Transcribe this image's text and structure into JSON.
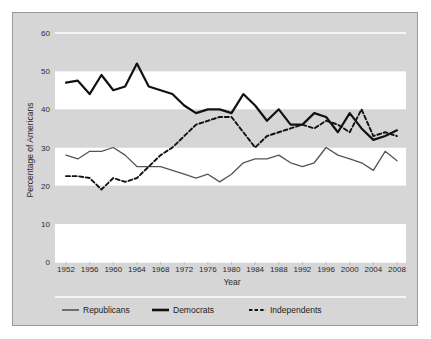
{
  "figure": {
    "background_color": "#ffffff",
    "panel_color": "#d6d6d6",
    "panel_border_color": "#9a9a9a",
    "band_light_color": "#ffffff",
    "band_dark_color": "#d6d6d6"
  },
  "chart_data": {
    "type": "line",
    "title": "",
    "xlabel": "Year",
    "ylabel": "Percentage of Americans",
    "xlim": [
      1952,
      2008
    ],
    "ylim": [
      0,
      60
    ],
    "ytick_step": 10,
    "xtick_step": 4,
    "grid": false,
    "alternating_bands": true,
    "legend_position": "bottom",
    "ytick_labels": [
      "0",
      "10",
      "20",
      "30",
      "40",
      "50",
      "60"
    ],
    "ytick_values": [
      0,
      10,
      20,
      30,
      40,
      50,
      60
    ],
    "xtick_labels": [
      "1952",
      "1956",
      "1960",
      "1964",
      "1968",
      "1972",
      "1976",
      "1980",
      "1984",
      "1988",
      "1992",
      "1996",
      "2000",
      "2004",
      "2008"
    ],
    "xtick_values": [
      1952,
      1956,
      1960,
      1964,
      1968,
      1972,
      1976,
      1980,
      1984,
      1988,
      1992,
      1996,
      2000,
      2004,
      2008
    ],
    "x": [
      1952,
      1954,
      1956,
      1958,
      1960,
      1962,
      1964,
      1966,
      1968,
      1970,
      1972,
      1974,
      1976,
      1978,
      1980,
      1982,
      1984,
      1986,
      1988,
      1990,
      1992,
      1994,
      1996,
      1998,
      2000,
      2002,
      2004,
      2006,
      2008
    ],
    "series": [
      {
        "name": "Republicans",
        "color": "#555555",
        "style": "solid",
        "width": 1.3,
        "values": [
          28,
          27,
          29,
          29,
          30,
          28,
          25,
          25,
          25,
          24,
          23,
          22,
          23,
          21,
          23,
          26,
          27,
          27,
          28,
          26,
          25,
          26,
          30,
          28,
          27,
          26,
          24,
          29,
          26.5
        ]
      },
      {
        "name": "Democrats",
        "color": "#111111",
        "style": "solid",
        "width": 2.2,
        "values": [
          47,
          47.5,
          44,
          49,
          45,
          46,
          52,
          46,
          45,
          44,
          41,
          39,
          40,
          40,
          39,
          44,
          41,
          37,
          40,
          36,
          36,
          39,
          38,
          34,
          39,
          35,
          32,
          33,
          34.5
        ]
      },
      {
        "name": "Independents",
        "color": "#111111",
        "style": "dashed",
        "width": 1.9,
        "values": [
          22.5,
          22.5,
          22,
          19,
          22,
          21,
          22,
          25,
          28,
          30,
          33,
          36,
          37,
          38,
          38,
          34,
          30,
          33,
          34,
          35,
          36,
          35,
          37,
          36,
          34,
          40,
          33,
          34,
          33
        ]
      }
    ]
  },
  "legend": {
    "items": [
      {
        "label": "Republicans",
        "color": "#555555",
        "style": "solid",
        "width": 1.6
      },
      {
        "label": "Democrats",
        "color": "#111111",
        "style": "solid",
        "width": 2.6
      },
      {
        "label": "Independents",
        "color": "#111111",
        "style": "dashed",
        "width": 2.0
      }
    ]
  }
}
